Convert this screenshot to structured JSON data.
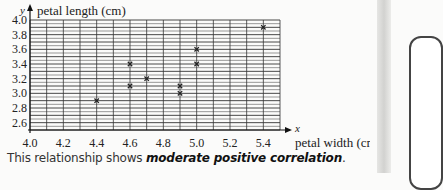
{
  "chart_data": {
    "type": "scatter",
    "title": "",
    "xlabel": "petal width (cm)",
    "ylabel": "petal length (cm)",
    "x_axis_symbol": "x",
    "y_axis_symbol": "y",
    "xlim": [
      4.0,
      5.5
    ],
    "ylim": [
      2.5,
      4.0
    ],
    "x_ticks": [
      "4.0",
      "4.2",
      "4.4",
      "4.6",
      "4.8",
      "5.0",
      "5.2",
      "5.4"
    ],
    "y_ticks": [
      "4.0",
      "3.8",
      "3.6",
      "3.4",
      "3.2",
      "3.0",
      "2.8",
      "2.6"
    ],
    "grid": true,
    "marker": "x",
    "points": [
      {
        "x": 4.4,
        "y": 2.9
      },
      {
        "x": 4.6,
        "y": 3.4
      },
      {
        "x": 4.6,
        "y": 3.1
      },
      {
        "x": 4.7,
        "y": 3.2
      },
      {
        "x": 4.9,
        "y": 3.1
      },
      {
        "x": 4.9,
        "y": 3.0
      },
      {
        "x": 5.0,
        "y": 3.6
      },
      {
        "x": 5.0,
        "y": 3.4
      },
      {
        "x": 5.4,
        "y": 3.9
      }
    ]
  },
  "caption": {
    "prefix": "This relationship shows ",
    "emphasis": "moderate positive correlation",
    "suffix": "."
  }
}
